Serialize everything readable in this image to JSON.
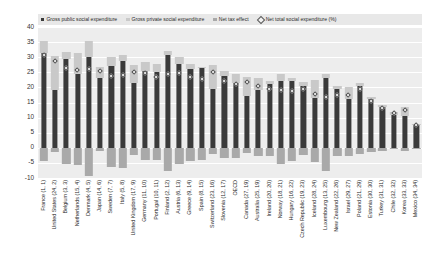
{
  "legend": {
    "items": [
      {
        "label": "Gross public social expenditure",
        "marker": "square",
        "color": "#3a3a3a"
      },
      {
        "label": "Gross private social expenditure",
        "marker": "square",
        "color": "#c9c9c9"
      },
      {
        "label": "Net tax effect",
        "marker": "square",
        "color": "#a9a9a9"
      },
      {
        "label": "Net total social expenditure (%)",
        "marker": "diamond",
        "color": "#f2f2f2"
      }
    ]
  },
  "axis": {
    "y_ticks": [
      "40",
      "35",
      "30",
      "25",
      "20",
      "15",
      "10",
      "5",
      "0",
      "-5",
      "-10"
    ]
  },
  "chart_data": {
    "type": "bar",
    "title": "",
    "subtitle": "",
    "xlabel": "",
    "ylabel": "",
    "ylim": [
      -10,
      40
    ],
    "ytick_step": 5,
    "grid": true,
    "stacked": true,
    "legend_position": "top",
    "categories": [
      "France (1, 1)",
      "United States (24, 2)",
      "Belgium (3, 3)",
      "Netherlands (15, 4)",
      "Denmark (4, 5)",
      "Japan (14, 6)",
      "Sweden (7, 7)",
      "Italy (5, 8)",
      "United Kingdom (17, 9)",
      "Germany (11, 10)",
      "Portugal (10, 11)",
      "Finland (2, 12)",
      "Austria (6, 13)",
      "Greece (9, 14)",
      "Spain (8, 15)",
      "Switzerland (23, 16)",
      "Slovenia (12, 17)",
      "OECD",
      "Canada (27, 19)",
      "Australia (25, 19)",
      "Ireland (20, 20)",
      "Norway (18, 21)",
      "Hungary (16, 22)",
      "Czech Republic (19, 23)",
      "Iceland (28, 24)",
      "Luxembourg (13, 25)",
      "New Zealand (22, 26)",
      "Israel (29, 27)",
      "Poland (21, 29)",
      "Estonia (30, 30)",
      "Turkey (31, 31)",
      "Chile (32, 32)",
      "Korea (33, 33)",
      "Mexico (34, 34)"
    ],
    "series": [
      {
        "name": "Gross public social expenditure",
        "color": "#3a3a3a",
        "values": [
          31.5,
          19.0,
          29.4,
          24.3,
          30.1,
          23.1,
          27.1,
          28.6,
          21.5,
          25.4,
          25.2,
          30.8,
          27.8,
          26.0,
          26.3,
          19.4,
          23.7,
          21.6,
          17.2,
          19.0,
          21.0,
          22.0,
          22.1,
          20.6,
          16.5,
          23.0,
          19.4,
          16.0,
          20.6,
          16.1,
          13.5,
          10.9,
          10.4,
          7.5
        ]
      },
      {
        "name": "Gross private social expenditure",
        "color": "#c9c9c9",
        "values": [
          3.9,
          11.3,
          2.2,
          7.2,
          5.3,
          3.5,
          3.1,
          2.1,
          6.0,
          3.1,
          2.4,
          1.3,
          2.2,
          1.9,
          0.6,
          7.9,
          1.8,
          2.8,
          6.1,
          4.0,
          1.2,
          2.4,
          1.1,
          1.2,
          6.1,
          1.6,
          0.9,
          4.0,
          1.0,
          0.6,
          0.6,
          1.1,
          3.1,
          0.3
        ]
      },
      {
        "name": "Net tax effect",
        "color": "#a9a9a9",
        "values": [
          -4.5,
          -1.5,
          -5.2,
          -5.8,
          -9.3,
          -1.1,
          -6.5,
          -6.6,
          -2.3,
          -3.9,
          -4.2,
          -7.8,
          -5.3,
          -4.4,
          -4.1,
          -2.2,
          -3.4,
          -3.4,
          -1.6,
          -2.6,
          -2.6,
          -5.2,
          -4.3,
          -2.3,
          -4.7,
          -7.7,
          -2.8,
          -2.6,
          -2.2,
          -1.3,
          -0.9,
          -0.5,
          -0.9,
          -0.4
        ]
      }
    ],
    "marker_series": {
      "name": "Net total social expenditure (%)",
      "marker": "diamond",
      "color": "#f0f0f0",
      "values": [
        30.8,
        28.8,
        26.4,
        25.7,
        26.1,
        25.5,
        23.7,
        24.1,
        25.2,
        24.6,
        23.4,
        24.3,
        24.7,
        23.5,
        22.8,
        25.1,
        22.1,
        21.0,
        21.7,
        20.4,
        19.6,
        19.2,
        18.9,
        19.5,
        17.9,
        16.9,
        17.5,
        17.4,
        19.4,
        15.4,
        13.2,
        11.5,
        12.6,
        7.4
      ]
    }
  }
}
